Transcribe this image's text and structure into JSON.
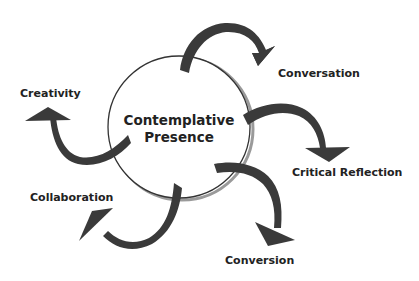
{
  "diagram": {
    "center": {
      "line1": "Contemplative",
      "line2": "Presence"
    },
    "nodes": [
      {
        "id": "conversation",
        "label": "Conversation"
      },
      {
        "id": "critical-reflection",
        "label": "Critical Reflection"
      },
      {
        "id": "conversion",
        "label": "Conversion"
      },
      {
        "id": "collaboration",
        "label": "Collaboration"
      },
      {
        "id": "creativity",
        "label": "Creativity"
      }
    ],
    "colors": {
      "arrow": "#3a3a3a",
      "circle_stroke": "#333333",
      "circle_shadow": "#9a9a9a",
      "text": "#222222"
    }
  }
}
